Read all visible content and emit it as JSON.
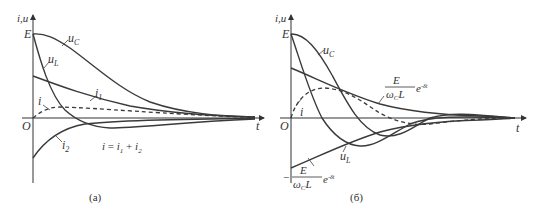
{
  "panels": [
    {
      "id": "a",
      "caption": "(a)",
      "axis_y_label": "i,u",
      "axis_x_label": "t",
      "origin_label": "O",
      "level_label": "E",
      "curves": {
        "uC": {
          "label_main": "u",
          "label_sub": "C"
        },
        "uL": {
          "label_main": "u",
          "label_sub": "L"
        },
        "i1": {
          "label_main": "i",
          "label_sub": "1"
        },
        "i2": {
          "label_main": "i",
          "label_sub": "2"
        },
        "i": {
          "label_main": "i"
        }
      },
      "equation": {
        "lhs": "i",
        "eq": " = ",
        "t1": "i",
        "s1": "1",
        "plus": " + ",
        "t2": "i",
        "s2": "2"
      }
    },
    {
      "id": "b",
      "caption": "(б)",
      "axis_y_label": "i,u",
      "axis_x_label": "t",
      "origin_label": "O",
      "level_label": "E",
      "curves": {
        "uC": {
          "label_main": "u",
          "label_sub": "C"
        },
        "uL": {
          "label_main": "u",
          "label_sub": "L"
        },
        "i": {
          "label_main": "i"
        }
      },
      "envelope_pos": {
        "num": "E",
        "den_main": "ω",
        "den_sub": "C",
        "den_tail": "L",
        "exp": "e",
        "exp_sup": "-δt"
      },
      "envelope_neg": {
        "sign": "−",
        "num": "E",
        "den_main": "ω",
        "den_sub": "C",
        "den_tail": "L",
        "exp": "e",
        "exp_sup": "-δt"
      }
    }
  ]
}
